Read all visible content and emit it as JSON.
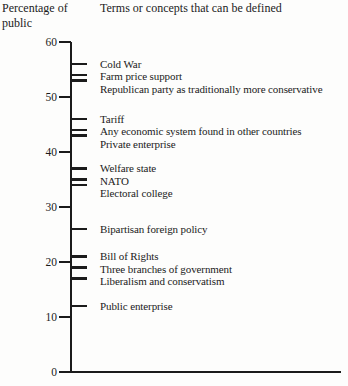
{
  "axis_header": {
    "line1": "Percentage of",
    "line2": "public"
  },
  "terms_header": "Terms or concepts that can be defined",
  "colors": {
    "ink": "#1b1b1b",
    "background": "#fdfdfc"
  },
  "chart_data": {
    "type": "scatter",
    "title": "Terms or concepts that can be defined",
    "ylabel": "Percentage of public",
    "ylim": [
      0,
      60
    ],
    "yticks": [
      60,
      50,
      40,
      30,
      20,
      10,
      0
    ],
    "grid": false,
    "legend": false,
    "orientation": "vertical axis with labeled tick marks, one per concept",
    "categories": [
      "Cold War",
      "Farm price support",
      "Republican party as traditionally more conservative",
      "Tariff",
      "Any economic system found in other countries",
      "Private enterprise",
      "Welfare state",
      "NATO",
      "Electoral college",
      "Bipartisan foreign policy",
      "Bill of Rights",
      "Three branches of government",
      "Liberalism and conservatism",
      "Public enterprise"
    ],
    "values": [
      56,
      54,
      53,
      46,
      44,
      43,
      37,
      35,
      34,
      26,
      21,
      19,
      17,
      12
    ]
  }
}
